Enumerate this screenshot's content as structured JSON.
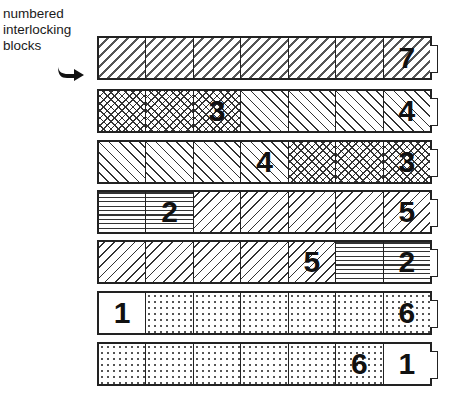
{
  "caption": {
    "lines": [
      "numbered",
      "interlocking",
      "blocks"
    ]
  },
  "icons": {
    "pointer": "curved-arrow-right-icon"
  },
  "colors": {
    "line": "#222222",
    "text": "#111111",
    "background": "#ffffff"
  },
  "rows": [
    {
      "top": 36,
      "cells": [
        {
          "pattern": "dash",
          "number": ""
        },
        {
          "pattern": "dash",
          "number": ""
        },
        {
          "pattern": "dash",
          "number": ""
        },
        {
          "pattern": "dash",
          "number": ""
        },
        {
          "pattern": "dash",
          "number": ""
        },
        {
          "pattern": "dash",
          "number": ""
        },
        {
          "pattern": "dash",
          "number": "7"
        }
      ]
    },
    {
      "top": 89,
      "cells": [
        {
          "pattern": "cross",
          "number": ""
        },
        {
          "pattern": "cross",
          "number": ""
        },
        {
          "pattern": "cross",
          "number": "3"
        },
        {
          "pattern": "back",
          "number": ""
        },
        {
          "pattern": "back",
          "number": ""
        },
        {
          "pattern": "back",
          "number": ""
        },
        {
          "pattern": "back",
          "number": "4"
        }
      ]
    },
    {
      "top": 140,
      "cells": [
        {
          "pattern": "back",
          "number": ""
        },
        {
          "pattern": "back",
          "number": ""
        },
        {
          "pattern": "back",
          "number": ""
        },
        {
          "pattern": "back",
          "number": "4"
        },
        {
          "pattern": "cross",
          "number": ""
        },
        {
          "pattern": "cross",
          "number": ""
        },
        {
          "pattern": "cross",
          "number": "3"
        }
      ]
    },
    {
      "top": 190,
      "cells": [
        {
          "pattern": "horiz",
          "number": ""
        },
        {
          "pattern": "horiz",
          "number": "2"
        },
        {
          "pattern": "fwd",
          "number": ""
        },
        {
          "pattern": "fwd",
          "number": ""
        },
        {
          "pattern": "fwd",
          "number": ""
        },
        {
          "pattern": "fwd",
          "number": ""
        },
        {
          "pattern": "fwd",
          "number": "5"
        }
      ]
    },
    {
      "top": 240,
      "cells": [
        {
          "pattern": "fwd",
          "number": ""
        },
        {
          "pattern": "fwd",
          "number": ""
        },
        {
          "pattern": "fwd",
          "number": ""
        },
        {
          "pattern": "fwd",
          "number": ""
        },
        {
          "pattern": "fwd",
          "number": "5"
        },
        {
          "pattern": "horiz",
          "number": ""
        },
        {
          "pattern": "horiz",
          "number": "2"
        }
      ]
    },
    {
      "top": 291,
      "cells": [
        {
          "pattern": "blank",
          "number": "1"
        },
        {
          "pattern": "dots",
          "number": ""
        },
        {
          "pattern": "dots",
          "number": ""
        },
        {
          "pattern": "dots",
          "number": ""
        },
        {
          "pattern": "dots",
          "number": ""
        },
        {
          "pattern": "dots",
          "number": ""
        },
        {
          "pattern": "dots",
          "number": "6"
        }
      ]
    },
    {
      "top": 342,
      "cells": [
        {
          "pattern": "dots",
          "number": ""
        },
        {
          "pattern": "dots",
          "number": ""
        },
        {
          "pattern": "dots",
          "number": ""
        },
        {
          "pattern": "dots",
          "number": ""
        },
        {
          "pattern": "dots",
          "number": ""
        },
        {
          "pattern": "dots",
          "number": "6"
        },
        {
          "pattern": "blank",
          "number": "1"
        }
      ]
    }
  ]
}
